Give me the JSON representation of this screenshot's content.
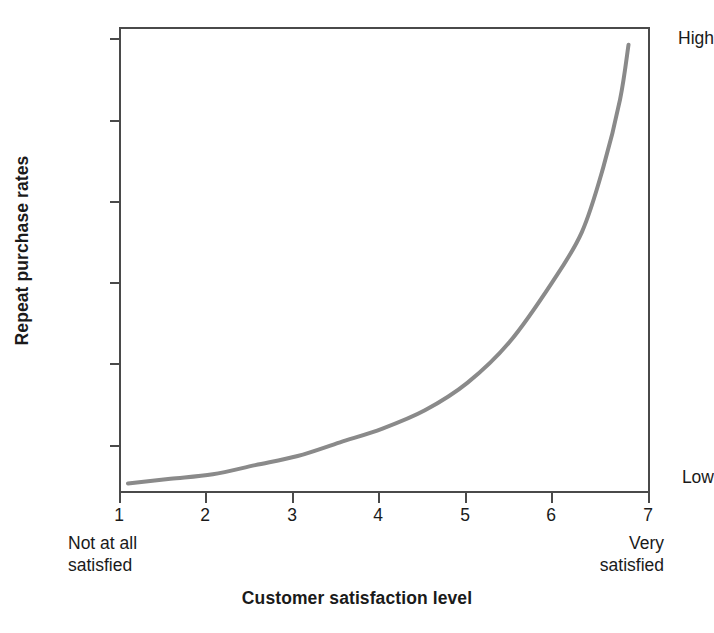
{
  "chart_data": {
    "type": "line",
    "title": "",
    "xlabel": "Customer satisfaction level",
    "ylabel": "Repeat purchase rates",
    "x": [
      1,
      2,
      3,
      4,
      5,
      6,
      7
    ],
    "xticklabels": [
      "1",
      "2",
      "3",
      "4",
      "5",
      "6",
      "7"
    ],
    "xlim": [
      1,
      7
    ],
    "ylim": [
      0,
      100
    ],
    "yticklabels": [
      "High",
      "Low"
    ],
    "ytick_positions": [
      "top",
      "bottom"
    ],
    "y_axis_note": "Unlabeled interior ticks; only qualitative endpoints Low and High are marked",
    "x_endpoint_captions": {
      "left": "Not at all satisfied",
      "right": "Very satisfied"
    },
    "grid": false,
    "legend": false,
    "series": [
      {
        "name": "Repeat purchase rate",
        "color": "#8a8a8a",
        "linewidth": 4,
        "shape": "exponential",
        "values": [
          1,
          3,
          7,
          13,
          23,
          45,
          97
        ],
        "points": [
          {
            "x": 1.0,
            "y": 1
          },
          {
            "x": 1.5,
            "y": 2
          },
          {
            "x": 2.0,
            "y": 3
          },
          {
            "x": 2.5,
            "y": 5
          },
          {
            "x": 3.0,
            "y": 7
          },
          {
            "x": 3.5,
            "y": 10
          },
          {
            "x": 4.0,
            "y": 13
          },
          {
            "x": 4.5,
            "y": 17
          },
          {
            "x": 5.0,
            "y": 23
          },
          {
            "x": 5.5,
            "y": 32
          },
          {
            "x": 6.0,
            "y": 45
          },
          {
            "x": 6.35,
            "y": 56
          },
          {
            "x": 6.6,
            "y": 70
          },
          {
            "x": 6.8,
            "y": 85
          },
          {
            "x": 6.9,
            "y": 97
          }
        ]
      }
    ]
  },
  "axes": {
    "y_title": "Repeat purchase rates",
    "y_label_high": "High",
    "y_label_low": "Low",
    "x_title": "Customer satisfaction level",
    "x_ticks": [
      "1",
      "2",
      "3",
      "4",
      "5",
      "6",
      "7"
    ],
    "x_caption_left_line1": "Not at all",
    "x_caption_left_line2": "satisfied",
    "x_caption_right_line1": "Very",
    "x_caption_right_line2": "satisfied"
  },
  "colors": {
    "curve": "#8a8a8a",
    "axis": "#4a4a4a",
    "text": "#1a1a1a",
    "background": "#ffffff"
  }
}
